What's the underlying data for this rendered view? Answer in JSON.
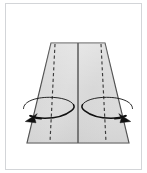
{
  "figure": {
    "title": "Fold side panels inward",
    "caption": "",
    "background_color": "#ffffff",
    "frame": {
      "visible": true,
      "border_color": "#d3d5d8",
      "x": 5,
      "y": 3,
      "width": 137,
      "height": 167
    }
  },
  "shape": {
    "name": "trapezoid-panel",
    "fill_color": "#dcdcdc",
    "stroke_color": "#4a4a4a",
    "top_left_x": 51,
    "top_right_x": 105,
    "top_y": 43,
    "bottom_left_x": 27,
    "bottom_right_x": 129,
    "bottom_y": 143
  },
  "fold_lines": [
    {
      "name": "center-fold-line",
      "style": "solid",
      "color": "#5a5a5a",
      "x_top": 78,
      "x_bottom": 78
    },
    {
      "name": "left-fold-line",
      "style": "dashed",
      "color": "#3c3c3c",
      "x_top": 55,
      "x_bottom": 50
    },
    {
      "name": "right-fold-line",
      "style": "dashed",
      "color": "#3c3c3c",
      "x_top": 101,
      "x_bottom": 106
    }
  ],
  "rotation_arrows": [
    {
      "name": "left-rotation-arrow",
      "direction": "inward-left",
      "color": "#111111",
      "ellipse_cx": 48,
      "ellipse_cy": 110,
      "ellipse_rx": 25,
      "ellipse_ry": 10
    },
    {
      "name": "right-rotation-arrow",
      "direction": "inward-right",
      "color": "#111111",
      "ellipse_cx": 108,
      "ellipse_cy": 110,
      "ellipse_rx": 25,
      "ellipse_ry": 10
    }
  ],
  "labels": {
    "step_number": "",
    "note": ""
  }
}
